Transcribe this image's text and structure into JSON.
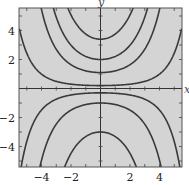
{
  "chart_data": {
    "type": "line",
    "title": "",
    "xlabel": "x",
    "ylabel": "y",
    "xlim": [
      -5.5,
      5.5
    ],
    "ylim": [
      -5.5,
      5.5
    ],
    "grid": false,
    "legend": null,
    "background_color": "#d4d4d4",
    "curve_color": "#3a3a3a",
    "x_ticks": [
      -4,
      -2,
      2,
      4
    ],
    "y_ticks": [
      -4,
      -2,
      2,
      4
    ],
    "x_tick_labels": [
      "−4",
      "−2",
      "2",
      "4"
    ],
    "y_tick_labels": [
      "−4",
      "−2",
      "2",
      "4"
    ],
    "model": "solution curves y = C·e^(x²/10)",
    "series": [
      {
        "name": "C=3.4",
        "C": 3.4
      },
      {
        "name": "C=2.0",
        "C": 2.0
      },
      {
        "name": "C=1.1",
        "C": 1.1
      },
      {
        "name": "C=0.2",
        "C": 0.2
      },
      {
        "name": "C=-0.3",
        "C": -0.3
      },
      {
        "name": "C=-1.0",
        "C": -1.0
      },
      {
        "name": "C=-3.0",
        "C": -3.0
      }
    ]
  },
  "labels": {
    "x_axis": "x",
    "y_axis": "y"
  }
}
